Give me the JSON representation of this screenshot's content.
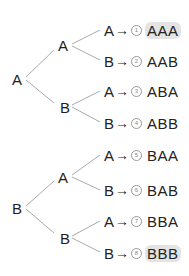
{
  "trees": [
    {
      "root": "A",
      "children": [
        {
          "label": "A",
          "leaves": [
            {
              "label": "A",
              "arrow": "→",
              "num": "1",
              "outcome": "AAA",
              "highlighted": true
            },
            {
              "label": "B",
              "arrow": "→",
              "num": "2",
              "outcome": "AAB",
              "highlighted": false
            }
          ]
        },
        {
          "label": "B",
          "leaves": [
            {
              "label": "A",
              "arrow": "→",
              "num": "3",
              "outcome": "ABA",
              "highlighted": false
            },
            {
              "label": "B",
              "arrow": "→",
              "num": "4",
              "outcome": "ABB",
              "highlighted": false
            }
          ]
        }
      ]
    },
    {
      "root": "B",
      "children": [
        {
          "label": "A",
          "leaves": [
            {
              "label": "A",
              "arrow": "→",
              "num": "5",
              "outcome": "BAA",
              "highlighted": false
            },
            {
              "label": "B",
              "arrow": "→",
              "num": "6",
              "outcome": "BAB",
              "highlighted": false
            }
          ]
        },
        {
          "label": "B",
          "leaves": [
            {
              "label": "A",
              "arrow": "→",
              "num": "7",
              "outcome": "BBA",
              "highlighted": false
            },
            {
              "label": "B",
              "arrow": "→",
              "num": "8",
              "outcome": "BBB",
              "highlighted": true
            }
          ]
        }
      ]
    }
  ],
  "colors": {
    "line": "#aaaaaa",
    "text": "#1e1e1e",
    "highlight": "#e4e4e4"
  }
}
